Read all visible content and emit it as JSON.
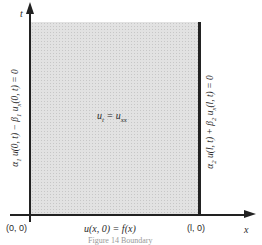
{
  "diagram": {
    "axes": {
      "vertical_label": "t",
      "horizontal_label": "x"
    },
    "points": {
      "origin": "(0, 0)",
      "right_corner": "(l, 0)"
    },
    "pde": {
      "lhs": "u",
      "lhs_sub": "t",
      "eq": " = ",
      "rhs": "u",
      "rhs_sub": "xx"
    },
    "initial_condition": "u(x, 0) = f(x)",
    "left_boundary": {
      "a": "α",
      "a_sub": "1",
      "term1": " u(0, t) − β",
      "b_sub": "1",
      "term2": " u",
      "u_sub": "x",
      "term3": "(0, t) = 0"
    },
    "right_boundary": {
      "a": "α",
      "a_sub": "2",
      "term1": " u(l, t) + β",
      "b_sub": "2",
      "term2": " u",
      "u_sub": "x",
      "term3": "(l, t) = 0"
    },
    "caption": "Figure 14  Boundary"
  },
  "colors": {
    "region_fill": "#e2e2e2",
    "line": "#222222"
  }
}
